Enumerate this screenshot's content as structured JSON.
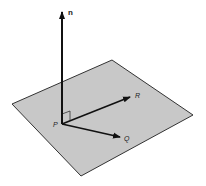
{
  "diagram": {
    "plane": {
      "fill": "#c8c8c8",
      "stroke": "#333333",
      "corners": [
        [
          112,
          60
        ],
        [
          193,
          115
        ],
        [
          81,
          176
        ],
        [
          12,
          104
        ]
      ]
    },
    "labels": {
      "n": "n",
      "P": "P",
      "R": "R",
      "Q": "Q"
    },
    "vectors": [
      {
        "name": "n",
        "from": [
          62,
          124
        ],
        "to": [
          62,
          11
        ]
      },
      {
        "name": "PR",
        "from": [
          62,
          124
        ],
        "to": [
          131,
          97
        ]
      },
      {
        "name": "PQ",
        "from": [
          62,
          124
        ],
        "to": [
          121,
          137
        ]
      }
    ],
    "right_angle_marker": true
  }
}
